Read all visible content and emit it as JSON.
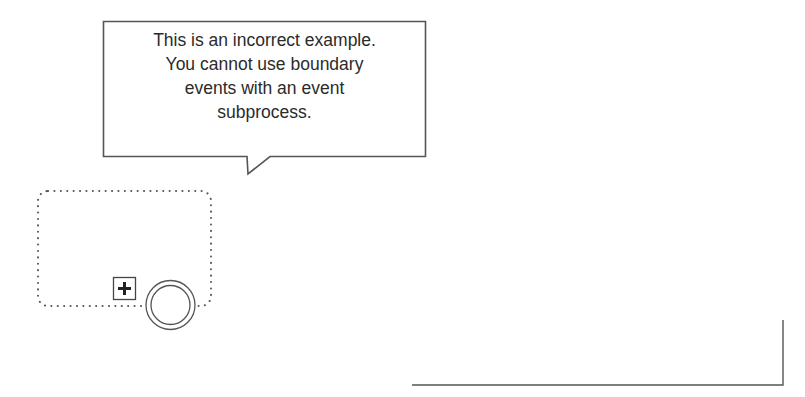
{
  "callout": {
    "lines": [
      "This is an incorrect example.",
      "You cannot use boundary",
      "events with an event",
      "subprocess."
    ]
  },
  "diagram": {
    "event_subprocess": {
      "style": "dotted",
      "collapsed_marker": "plus-icon"
    },
    "boundary_event": {
      "type": "intermediate",
      "style": "double-circle"
    },
    "colors": {
      "stroke": "#444444",
      "text": "#2b2b2b",
      "background": "#ffffff"
    }
  }
}
